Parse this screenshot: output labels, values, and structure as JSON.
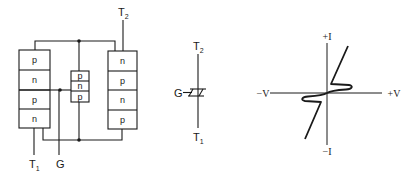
{
  "structure": {
    "left_block": {
      "layers": [
        "p",
        "n",
        "p",
        "n"
      ]
    },
    "center_block": {
      "layers": [
        "p",
        "n",
        "p"
      ]
    },
    "right_block": {
      "layers": [
        "n",
        "p",
        "n",
        "p"
      ]
    },
    "terminals": {
      "t1": {
        "main": "T",
        "sub": "1"
      },
      "t2": {
        "main": "T",
        "sub": "2"
      },
      "gate": "G"
    }
  },
  "symbol": {
    "t2": {
      "main": "T",
      "sub": "2"
    },
    "t1": {
      "main": "T",
      "sub": "1"
    },
    "gate": "G"
  },
  "characteristic": {
    "labels": {
      "plus_i": "+I",
      "minus_i": "−I",
      "minus_v": "−V",
      "plus_v": "+V"
    }
  },
  "colors": {
    "line": "#1a1a1a",
    "background": "#ffffff"
  }
}
